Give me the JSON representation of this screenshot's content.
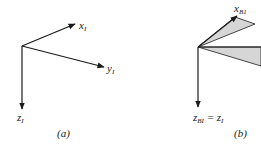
{
  "panel_a": {
    "axes": [
      {
        "name": "x",
        "subscript": "I"
      },
      {
        "name": "y",
        "subscript": "I"
      },
      {
        "name": "z",
        "subscript": "I"
      }
    ],
    "caption": "(a)"
  },
  "panel_b": {
    "axes": [
      {
        "name": "x",
        "subscript": "B1"
      },
      {
        "name": "z",
        "subscript": "BI",
        "equals": "= z",
        "equals_subscript": "I"
      }
    ],
    "caption": "(b)"
  },
  "colors": {
    "line": "#1a1a1a",
    "shade": "#d6d6d6"
  }
}
